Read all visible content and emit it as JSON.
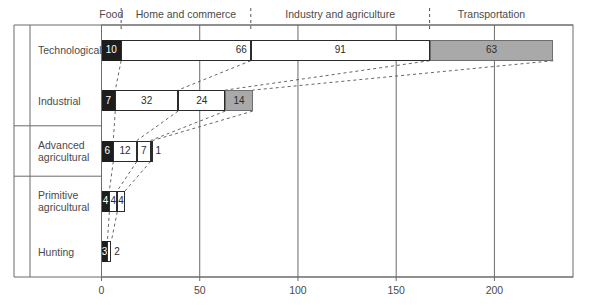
{
  "chart_data": {
    "type": "bar",
    "orientation": "horizontal",
    "stacked": true,
    "title": "",
    "xlabel": "",
    "ylabel": "",
    "xlim": [
      0,
      240
    ],
    "xticks": [
      0,
      50,
      100,
      150,
      200
    ],
    "xtick_labels": [
      "0",
      "50",
      "100",
      "150",
      "200"
    ],
    "grid": true,
    "legend_position": "top",
    "categories": [
      "Food",
      "Home and commerce",
      "Industry and agriculture",
      "Transportation"
    ],
    "category_boundaries": [
      0,
      10,
      66,
      91,
      63
    ],
    "row_groups": [
      {
        "label": "Global",
        "rows": [
          "Technological",
          "Industrial"
        ]
      },
      {
        "label": "Large",
        "rows": [
          "Advanced agricultural"
        ]
      },
      {
        "label": "Small",
        "rows": [
          "Primitive agricultural",
          "Hunting"
        ]
      }
    ],
    "rows": [
      {
        "label": "Technological",
        "label_lines": [
          "Technological"
        ],
        "group": "Global",
        "total": 230,
        "segments": [
          {
            "category": "Food",
            "value": 10,
            "label": "10",
            "fill": "dark",
            "label_pos": "inside"
          },
          {
            "category": "Home and commerce",
            "value": 66,
            "label": "66",
            "fill": "white",
            "label_pos": "inside-right"
          },
          {
            "category": "Industry and agriculture",
            "value": 91,
            "label": "91",
            "fill": "white",
            "label_pos": "inside"
          },
          {
            "category": "Transportation",
            "value": 63,
            "label": "63",
            "fill": "gray",
            "label_pos": "inside"
          }
        ]
      },
      {
        "label": "Industrial",
        "label_lines": [
          "Industrial"
        ],
        "group": "Global",
        "total": 77,
        "segments": [
          {
            "category": "Food",
            "value": 7,
            "label": "7",
            "fill": "dark",
            "label_pos": "inside"
          },
          {
            "category": "Home and commerce",
            "value": 32,
            "label": "32",
            "fill": "white",
            "label_pos": "inside"
          },
          {
            "category": "Industry and agriculture",
            "value": 24,
            "label": "24",
            "fill": "white",
            "label_pos": "inside"
          },
          {
            "category": "Transportation",
            "value": 14,
            "label": "14",
            "fill": "gray",
            "label_pos": "inside"
          }
        ]
      },
      {
        "label": "Advanced agricultural",
        "label_lines": [
          "Advanced",
          "agricultural"
        ],
        "group": "Large",
        "total": 26,
        "segments": [
          {
            "category": "Food",
            "value": 6,
            "label": "6",
            "fill": "dark",
            "label_pos": "inside"
          },
          {
            "category": "Home and commerce",
            "value": 12,
            "label": "12",
            "fill": "white",
            "label_pos": "inside"
          },
          {
            "category": "Industry and agriculture",
            "value": 7,
            "label": "7",
            "fill": "white",
            "label_pos": "inside"
          },
          {
            "category": "Transportation",
            "value": 1,
            "label": "1",
            "fill": "white",
            "label_pos": "outside"
          }
        ]
      },
      {
        "label": "Primitive agricultural",
        "label_lines": [
          "Primitive",
          "agricultural"
        ],
        "group": "Small",
        "total": 12,
        "segments": [
          {
            "category": "Food",
            "value": 4,
            "label": "4",
            "fill": "dark",
            "label_pos": "inside"
          },
          {
            "category": "Home and commerce",
            "value": 4,
            "label": "4",
            "fill": "white",
            "label_pos": "inside"
          },
          {
            "category": "Industry and agriculture",
            "value": 4,
            "label": "4",
            "fill": "white",
            "label_pos": "inside"
          }
        ]
      },
      {
        "label": "Hunting",
        "label_lines": [
          "Hunting"
        ],
        "group": "Small",
        "total": 5,
        "segments": [
          {
            "category": "Food",
            "value": 3,
            "label": "3",
            "fill": "dark",
            "label_pos": "inside"
          },
          {
            "category": "Home and commerce",
            "value": 2,
            "label": "2",
            "fill": "white",
            "label_pos": "outside"
          }
        ]
      }
    ],
    "colors": {
      "food": "#1d1d1d",
      "home_and_commerce": "#ffffff",
      "industry_and_agriculture": "#ffffff",
      "transportation": "#a9a9a9",
      "axis": "#6b6b6b",
      "text": "#4a4a4a",
      "dashed_connector": "#555555"
    }
  }
}
